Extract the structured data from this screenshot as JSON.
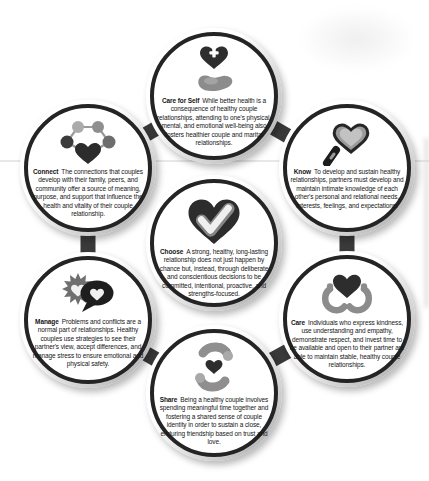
{
  "diagram": {
    "colors": {
      "ring": "#242424",
      "connector": "#3a3a3a",
      "icon_dark": "#2d2d2d",
      "icon_gray": "#8c8c8c",
      "background": "#ffffff"
    },
    "nodes": [
      {
        "id": "care-for-self",
        "label": "Care for Self",
        "icon": "heart-cross-and-hand-icon",
        "text": "While better health is a consequence of healthy couple relationships, attending to one's physical, mental, and emotional well-being also fosters healthier couple and marital relationships."
      },
      {
        "id": "know",
        "label": "Know",
        "icon": "heart-magnifier-icon",
        "text": "To develop and sustain healthy relationships, partners must develop and maintain intimate knowledge of each other's personal and relational needs, interests, feelings, and expectations."
      },
      {
        "id": "care",
        "label": "Care",
        "icon": "heart-in-hands-icon",
        "text": "Individuals who express kindness, use understanding and empathy, demonstrate respect, and invest time to be available and open to their partner are able to maintain stable, healthy couple relationships."
      },
      {
        "id": "share",
        "label": "Share",
        "icon": "sharing-hands-heart-icon",
        "text": "Being a healthy couple involves spending meaningful time together and fostering a shared sense of couple identity in order to sustain a close, enduring friendship based on trust and love."
      },
      {
        "id": "manage",
        "label": "Manage",
        "icon": "conflict-speech-bubbles-icon",
        "text": "Problems and conflicts are a normal part of relationships. Healthy couples use strategies to see their partner's view, accept differences, and manage stress to ensure emotional and physical safety."
      },
      {
        "id": "connect",
        "label": "Connect",
        "icon": "network-heart-icon",
        "text": "The connections that couples develop with their family, peers, and community offer a source of meaning, purpose, and support that influence the health and vitality of their couple relationship."
      },
      {
        "id": "choose",
        "label": "Choose",
        "icon": "heart-checkmark-icon",
        "text": "A strong, healthy, long-lasting relationship does not just happen by chance but, instead, through deliberate and conscientious decisions to be committed, intentional, proactive, and strengths-focused."
      }
    ]
  }
}
